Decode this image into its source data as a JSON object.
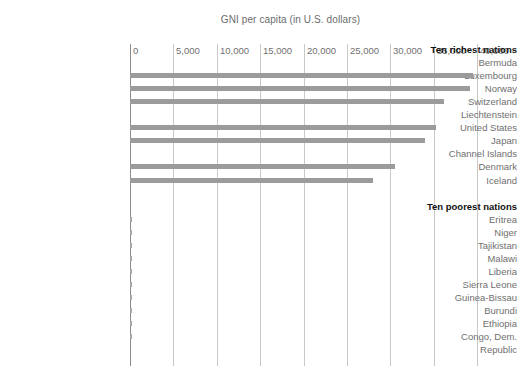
{
  "chart_data": {
    "type": "bar",
    "title": "GNI per capita (in U.S. dollars)",
    "xlabel": "",
    "ylabel": "",
    "orientation": "horizontal",
    "grid": true,
    "legend": false,
    "xlim": [
      0,
      40000
    ],
    "xticks": [
      0,
      5000,
      10000,
      15000,
      20000,
      25000,
      30000,
      35000,
      40000
    ],
    "xtick_labels": [
      "0",
      "5,000",
      "10,000",
      "15,000",
      "20,000",
      "25,000",
      "30,000",
      "35,000",
      "40,000"
    ],
    "groups": [
      {
        "name": "Ten richest nations",
        "categories": [
          "Bermuda",
          "Luxembourg",
          "Norway",
          "Switzerland",
          "Liechtenstein",
          "United States",
          "Japan",
          "Channel Islands",
          "Denmark",
          "Iceland"
        ],
        "values": [
          null,
          39500,
          39200,
          36200,
          null,
          35300,
          34000,
          null,
          30500,
          28000
        ]
      },
      {
        "name": "Ten poorest nations",
        "categories": [
          "Eritrea",
          "Niger",
          "Tajikistan",
          "Malawi",
          "Liberia",
          "Sierra Leone",
          "Guinea-Bissau",
          "Burundi",
          "Ethiopia",
          "Congo, Dem. Republic"
        ],
        "values": [
          200,
          200,
          190,
          180,
          170,
          160,
          150,
          110,
          110,
          100
        ]
      }
    ]
  },
  "colors": {
    "bar": "#9b9b9b",
    "gridline": "#c9c9c9",
    "axis": "#8c8c8c",
    "label_text": "#6f6f6f",
    "heading_text": "#111111",
    "background": "#ffffff"
  },
  "rows": [
    {
      "label": "Ten richest nations",
      "kind": "group-head"
    },
    {
      "label": "Bermuda",
      "kind": "category"
    },
    {
      "label": "Luxembourg",
      "kind": "category"
    },
    {
      "label": "Norway",
      "kind": "category"
    },
    {
      "label": "Switzerland",
      "kind": "category"
    },
    {
      "label": "Liechtenstein",
      "kind": "category"
    },
    {
      "label": "United States",
      "kind": "category"
    },
    {
      "label": "Japan",
      "kind": "category"
    },
    {
      "label": "Channel Islands",
      "kind": "category"
    },
    {
      "label": "Denmark",
      "kind": "category"
    },
    {
      "label": "Iceland",
      "kind": "category"
    },
    {
      "label": "",
      "kind": "spacer"
    },
    {
      "label": "Ten poorest nations",
      "kind": "group-head"
    },
    {
      "label": "Eritrea",
      "kind": "category"
    },
    {
      "label": "Niger",
      "kind": "category"
    },
    {
      "label": "Tajikistan",
      "kind": "category"
    },
    {
      "label": "Malawi",
      "kind": "category"
    },
    {
      "label": "Liberia",
      "kind": "category"
    },
    {
      "label": "Sierra Leone",
      "kind": "category"
    },
    {
      "label": "Guinea-Bissau",
      "kind": "category"
    },
    {
      "label": "Burundi",
      "kind": "category"
    },
    {
      "label": "Ethiopia",
      "kind": "category"
    },
    {
      "label": "Congo, Dem.",
      "kind": "category"
    },
    {
      "label": "Republic",
      "kind": "category"
    }
  ]
}
